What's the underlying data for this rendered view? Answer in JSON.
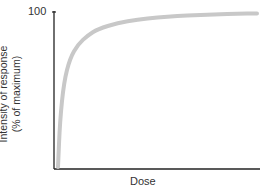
{
  "chart_data": {
    "type": "line",
    "title": "",
    "xlabel": "Dose",
    "ylabel_line1": "Intensity of response",
    "ylabel_line2": "(% of maximum)",
    "y_ticks": [
      "100"
    ],
    "ylim": [
      0,
      100
    ],
    "xlim": [
      0,
      1
    ],
    "grid": false,
    "legend": null,
    "series": [
      {
        "name": "dose-response",
        "color": "#c8c8c8",
        "x": [
          0.0,
          0.01,
          0.03,
          0.06,
          0.1,
          0.15,
          0.2,
          0.3,
          0.4,
          0.5,
          0.6,
          0.7,
          0.8,
          0.9,
          1.0
        ],
        "y": [
          0,
          30,
          55,
          70,
          79,
          85,
          89,
          93,
          95,
          96.5,
          97.5,
          98,
          98.5,
          99,
          99
        ]
      }
    ]
  },
  "colors": {
    "axis": "#222222",
    "curve": "#c8c8c8"
  }
}
